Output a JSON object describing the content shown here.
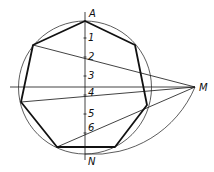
{
  "diagram": {
    "colors": {
      "stroke": "#111111",
      "thin": "#333333",
      "background": "#ffffff"
    },
    "circle": {
      "cx": 85,
      "cy": 87.5,
      "r": 66.5
    },
    "heptagon": {
      "vertices": [
        [
          85,
          21
        ],
        [
          135,
          45
        ],
        [
          147,
          105
        ],
        [
          115,
          147
        ],
        [
          57,
          147
        ],
        [
          21,
          102
        ],
        [
          33,
          45
        ]
      ]
    },
    "axes": {
      "vertical": {
        "x1": 85,
        "y1": 12,
        "x2": 85,
        "y2": 160
      },
      "horizontal": {
        "x1": 10,
        "y1": 87,
        "x2": 195,
        "y2": 87
      }
    },
    "rays": [
      {
        "from": "M",
        "to_vertex": "upper-left",
        "x1": 195,
        "y1": 87,
        "x2": 33,
        "y2": 45
      },
      {
        "from": "M",
        "to_vertex": "left",
        "x1": 195,
        "y1": 87,
        "x2": 21,
        "y2": 102
      },
      {
        "from": "M",
        "to_vertex": "lower-left",
        "x1": 195,
        "y1": 87,
        "x2": 57,
        "y2": 147
      }
    ],
    "arc": {
      "description": "arc centered at N through M",
      "path": "M 85 154 A 110 110 0 0 0 195 87"
    },
    "labels": {
      "A": {
        "text": "A",
        "x": 89,
        "y": 17
      },
      "p1": {
        "text": "1",
        "x": 88,
        "y": 41
      },
      "p2": {
        "text": "2",
        "x": 88,
        "y": 60
      },
      "p3": {
        "text": "3",
        "x": 88,
        "y": 79
      },
      "p4": {
        "text": "4",
        "x": 88,
        "y": 96
      },
      "p5": {
        "text": "5",
        "x": 88,
        "y": 117
      },
      "p6": {
        "text": "6",
        "x": 88,
        "y": 131
      },
      "N": {
        "text": "N",
        "x": 88,
        "y": 165
      },
      "M": {
        "text": "M",
        "x": 199,
        "y": 91
      }
    },
    "ticks": [
      38,
      57,
      76,
      95,
      114,
      133
    ]
  }
}
